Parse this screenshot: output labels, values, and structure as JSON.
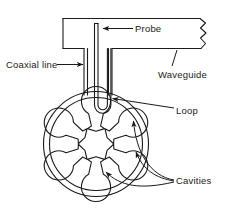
{
  "figure": {
    "type": "technical-line-diagram",
    "stroke_color": "#1a1a1a",
    "background_color": "#ffffff",
    "labels": {
      "probe": "Probe",
      "coaxial_line": "Coaxial line",
      "waveguide": "Waveguide",
      "loop": "Loop",
      "cavities": "Cavities"
    },
    "parts": {
      "waveguide": {
        "name": "waveguide",
        "shape": "rectangular-duct-with-break",
        "break_symbol": "zigzag"
      },
      "coaxial_line": {
        "name": "coaxial-line",
        "shape": "vertical-twin-line"
      },
      "probe": {
        "name": "probe",
        "shape": "vertical-inner-conductor"
      },
      "loop": {
        "name": "loop",
        "shape": "u-bend-hairpin"
      },
      "anode_block": {
        "name": "anode-block",
        "shape": "circle",
        "cavity_count": 6,
        "cavity_type": "hole-and-slot"
      }
    }
  }
}
